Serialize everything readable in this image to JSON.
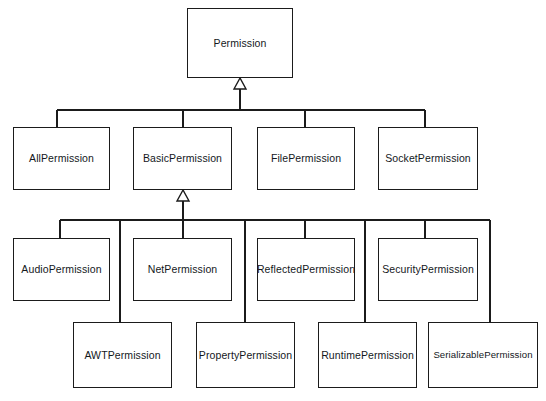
{
  "diagram": {
    "type": "uml-class-diagram",
    "relationship_kind": "generalization",
    "colors": {
      "background": "#ffffff",
      "stroke": "#1b1b1b",
      "box_fill": "#ffffff",
      "text": "#14181c"
    },
    "rows": [
      {
        "name": "root",
        "classes": [
          {
            "id": "permission",
            "label": "Permission",
            "x": 187,
            "y": 8,
            "w": 106,
            "h": 70
          }
        ]
      },
      {
        "name": "level-2",
        "classes": [
          {
            "id": "all-permission",
            "label": "AllPermission",
            "x": 13,
            "y": 127,
            "w": 97,
            "h": 63
          },
          {
            "id": "basic-permission",
            "label": "BasicPermission",
            "x": 133,
            "y": 127,
            "w": 99,
            "h": 63
          },
          {
            "id": "file-permission",
            "label": "FilePermission",
            "x": 257,
            "y": 127,
            "w": 98,
            "h": 63
          },
          {
            "id": "socket-permission",
            "label": "SocketPermission",
            "x": 378,
            "y": 127,
            "w": 100,
            "h": 63
          }
        ]
      },
      {
        "name": "level-3-upper",
        "classes": [
          {
            "id": "audio-permission",
            "label": "AudioPermission",
            "x": 13,
            "y": 238,
            "w": 97,
            "h": 63
          },
          {
            "id": "net-permission",
            "label": "NetPermission",
            "x": 133,
            "y": 238,
            "w": 99,
            "h": 63
          },
          {
            "id": "reflected-permission",
            "label": "ReflectedPermission",
            "x": 257,
            "y": 238,
            "w": 98,
            "h": 63
          },
          {
            "id": "security-permission",
            "label": "SecurityPermission",
            "x": 378,
            "y": 238,
            "w": 100,
            "h": 63
          }
        ]
      },
      {
        "name": "level-3-lower",
        "classes": [
          {
            "id": "awt-permission",
            "label": "AWTPermission",
            "x": 73,
            "y": 322,
            "w": 99,
            "h": 66
          },
          {
            "id": "property-permission",
            "label": "PropertyPermission",
            "x": 196,
            "y": 322,
            "w": 99,
            "h": 66
          },
          {
            "id": "runtime-permission",
            "label": "RuntimePermission",
            "x": 318,
            "y": 322,
            "w": 99,
            "h": 66
          },
          {
            "id": "serializable-permission",
            "label": "SerializablePermission",
            "x": 428,
            "y": 322,
            "w": 110,
            "h": 66
          }
        ]
      }
    ],
    "edges": [
      {
        "from": "all-permission",
        "to": "permission",
        "kind": "generalization"
      },
      {
        "from": "basic-permission",
        "to": "permission",
        "kind": "generalization"
      },
      {
        "from": "file-permission",
        "to": "permission",
        "kind": "generalization"
      },
      {
        "from": "socket-permission",
        "to": "permission",
        "kind": "generalization"
      },
      {
        "from": "audio-permission",
        "to": "basic-permission",
        "kind": "generalization"
      },
      {
        "from": "awt-permission",
        "to": "basic-permission",
        "kind": "generalization"
      },
      {
        "from": "net-permission",
        "to": "basic-permission",
        "kind": "generalization"
      },
      {
        "from": "property-permission",
        "to": "basic-permission",
        "kind": "generalization"
      },
      {
        "from": "reflected-permission",
        "to": "basic-permission",
        "kind": "generalization"
      },
      {
        "from": "runtime-permission",
        "to": "basic-permission",
        "kind": "generalization"
      },
      {
        "from": "security-permission",
        "to": "basic-permission",
        "kind": "generalization"
      },
      {
        "from": "serializable-permission",
        "to": "basic-permission",
        "kind": "generalization"
      }
    ],
    "connectors": {
      "top_bus": {
        "y": 110,
        "x_start": 57,
        "x_end": 425,
        "drops": [
          57,
          183,
          305,
          425
        ],
        "riser_x": 240,
        "arrow_tip_y": 78
      },
      "lower_bus": {
        "y": 220,
        "x_start": 60,
        "x_end": 490,
        "drops": [
          60,
          120,
          183,
          245,
          305,
          365,
          425,
          490
        ],
        "riser_x": 183,
        "arrow_tip_y": 190
      }
    }
  }
}
